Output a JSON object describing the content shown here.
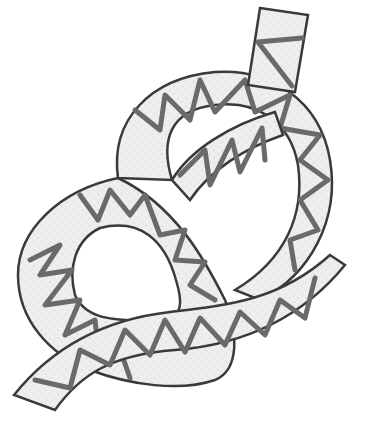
{
  "illustration": {
    "subject": "figure-eight knot tied in a patterned ribbon",
    "caption": "",
    "colors": {
      "background": "#ffffff",
      "ribbon_fill": "#ececec",
      "outline": "#3a3a3a",
      "zigzag": "#6a6a6a"
    }
  }
}
